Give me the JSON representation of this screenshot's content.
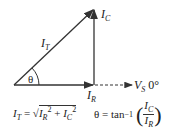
{
  "diagram": {
    "type": "phasor-diagram",
    "vectors": [
      {
        "name": "I_R",
        "label_main": "I",
        "label_sub": "R",
        "direction": "horizontal"
      },
      {
        "name": "I_C",
        "label_main": "I",
        "label_sub": "C",
        "direction": "vertical"
      },
      {
        "name": "I_T",
        "label_main": "I",
        "label_sub": "T",
        "direction": "diagonal"
      }
    ],
    "reference": {
      "label_main": "V",
      "label_sub": "S",
      "angle": "0°",
      "style": "dashed"
    },
    "angle_label": "θ",
    "formula_it": {
      "lhs_main": "I",
      "lhs_sub": "T",
      "eq": " = √",
      "t1_main": "I",
      "t1_sub": "R",
      "t1_sup": "2",
      "plus": " + ",
      "t2_main": "I",
      "t2_sub": "C",
      "t2_sup": "2"
    },
    "formula_theta": {
      "lhs": "θ = tan",
      "sup": "−1",
      "num_main": "I",
      "num_sub": "C",
      "den_main": "I",
      "den_sub": "R"
    },
    "colors": {
      "stroke": "#333333",
      "background": "#ffffff"
    }
  }
}
